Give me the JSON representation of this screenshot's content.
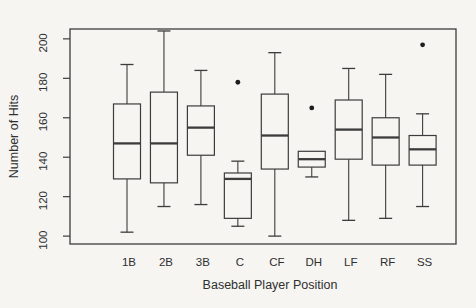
{
  "figure": {
    "background_color": "#f6f5f2",
    "line_color": "#3c3c3c",
    "outlier_color": "#1d1d1d"
  },
  "chart_data": {
    "type": "boxplot",
    "title": "",
    "xlabel": "Baseball Player Position",
    "ylabel": "Number of Hits",
    "ylim": [
      96,
      205
    ],
    "yticks": [
      100,
      120,
      140,
      160,
      180,
      200
    ],
    "grid": false,
    "legend": false,
    "categories": [
      "1B",
      "2B",
      "3B",
      "C",
      "CF",
      "DH",
      "LF",
      "RF",
      "SS"
    ],
    "series": [
      {
        "position": "1B",
        "whisker_low": 102,
        "q1": 129,
        "median": 147,
        "q3": 167,
        "whisker_high": 187,
        "outliers": []
      },
      {
        "position": "2B",
        "whisker_low": 115,
        "q1": 127,
        "median": 147,
        "q3": 173,
        "whisker_high": 204,
        "outliers": []
      },
      {
        "position": "3B",
        "whisker_low": 116,
        "q1": 141,
        "median": 155,
        "q3": 166,
        "whisker_high": 184,
        "outliers": []
      },
      {
        "position": "C",
        "whisker_low": 105,
        "q1": 109,
        "median": 129,
        "q3": 132,
        "whisker_high": 138,
        "outliers": [
          178
        ]
      },
      {
        "position": "CF",
        "whisker_low": 100,
        "q1": 134,
        "median": 151,
        "q3": 172,
        "whisker_high": 193,
        "outliers": []
      },
      {
        "position": "DH",
        "whisker_low": 130,
        "q1": 135,
        "median": 139,
        "q3": 143,
        "whisker_high": 143,
        "outliers": [
          165
        ]
      },
      {
        "position": "LF",
        "whisker_low": 108,
        "q1": 139,
        "median": 154,
        "q3": 169,
        "whisker_high": 185,
        "outliers": []
      },
      {
        "position": "RF",
        "whisker_low": 109,
        "q1": 136,
        "median": 150,
        "q3": 160,
        "whisker_high": 182,
        "outliers": []
      },
      {
        "position": "SS",
        "whisker_low": 115,
        "q1": 136,
        "median": 144,
        "q3": 151,
        "whisker_high": 162,
        "outliers": [
          197
        ]
      }
    ]
  }
}
